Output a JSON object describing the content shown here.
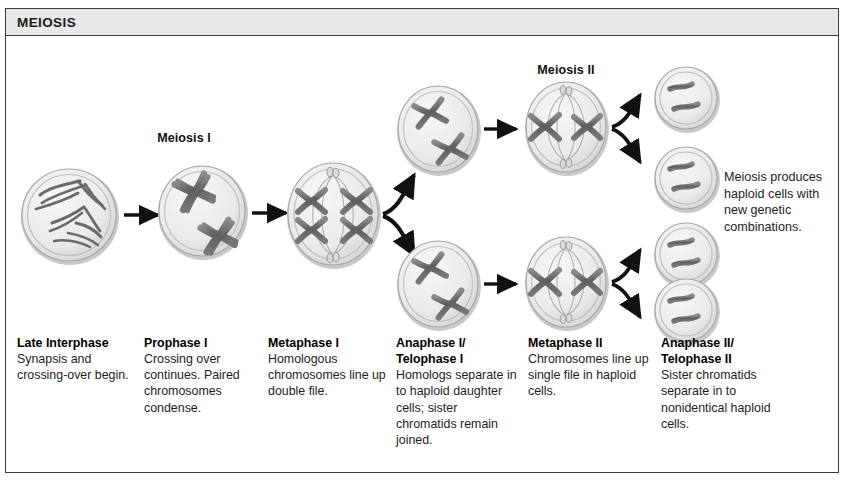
{
  "figure": {
    "title": "MEIOSIS",
    "border_color": "#3a3a3a",
    "title_bg": "#e8e8e8"
  },
  "stage_headers": [
    {
      "id": "meiosis-1",
      "label": "Meiosis I"
    },
    {
      "id": "meiosis-2",
      "label": "Meiosis II"
    }
  ],
  "annotation": {
    "text": "Meiosis produces haploid cells with new genetic combinations."
  },
  "captions": [
    {
      "heading": "Late  Interphase",
      "body": "Synapsis and crossing-over begin."
    },
    {
      "heading": "Prophase I",
      "body": "Crossing over continues. Paired chromosomes condense."
    },
    {
      "heading": "Metaphase I",
      "body": "Homologous chromosomes line up double file."
    },
    {
      "heading": "Anaphase I/ Telophase I",
      "body": "Homologs separate in to haploid daughter cells;  sister chromatids remain joined."
    },
    {
      "heading": "Metaphase II",
      "body": "Chromosomes line up single file in haploid cells."
    },
    {
      "heading": "Anaphase II/ Telophase II",
      "body": "Sister chromatids separate in to nonidentical haploid cells."
    }
  ],
  "cells": [
    {
      "id": "cell-late-interphase",
      "stage": "Late Interphase",
      "contents": "tangled chromatin threads",
      "chromosome_count": 4
    },
    {
      "id": "cell-prophase-1",
      "stage": "Prophase I",
      "contents": "two condensed tetrads",
      "chromosome_count": 2
    },
    {
      "id": "cell-metaphase-1",
      "stage": "Metaphase I",
      "contents": "four chromosomes aligned double file with spindle",
      "chromosome_count": 4
    },
    {
      "id": "cell-anaphase-1-top",
      "stage": "Anaphase I/Telophase I",
      "contents": "two X-shaped chromosomes",
      "chromosome_count": 2
    },
    {
      "id": "cell-anaphase-1-bottom",
      "stage": "Anaphase I/Telophase I",
      "contents": "two X-shaped chromosomes",
      "chromosome_count": 2
    },
    {
      "id": "cell-metaphase-2-top",
      "stage": "Metaphase II",
      "contents": "two chromosomes single file with spindle",
      "chromosome_count": 2
    },
    {
      "id": "cell-metaphase-2-bottom",
      "stage": "Metaphase II",
      "contents": "two chromosomes single file with spindle",
      "chromosome_count": 2
    },
    {
      "id": "cell-haploid-1",
      "stage": "Anaphase II/Telophase II",
      "contents": "two single chromatids",
      "chromosome_count": 2
    },
    {
      "id": "cell-haploid-2",
      "stage": "Anaphase II/Telophase II",
      "contents": "two single chromatids",
      "chromosome_count": 2
    },
    {
      "id": "cell-haploid-3",
      "stage": "Anaphase II/Telophase II",
      "contents": "two single chromatids",
      "chromosome_count": 2
    },
    {
      "id": "cell-haploid-4",
      "stage": "Anaphase II/Telophase II",
      "contents": "two single chromatids",
      "chromosome_count": 2
    }
  ],
  "colors": {
    "cell_fill": "#ececeb",
    "cell_edge": "#9a9a9a",
    "chromosome": "#6d6d6d",
    "chromosome_dark": "#4a4a4a",
    "arrow": "#111111",
    "text": "#1d1d1d"
  }
}
